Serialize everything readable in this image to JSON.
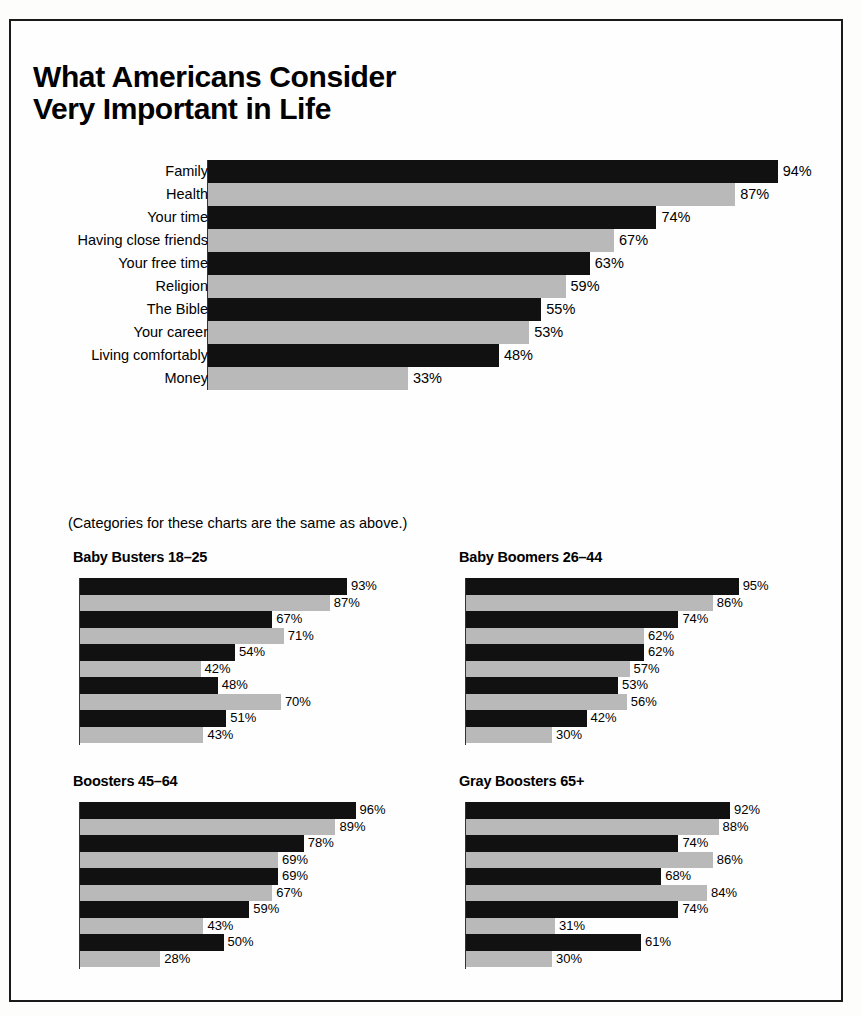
{
  "title": {
    "line1": "What Americans Consider",
    "line2": "Very Important in Life"
  },
  "note": "(Categories for these charts are the same as above.)",
  "chart_data": {
    "type": "bar",
    "title": "What Americans Consider Very Important in Life",
    "xlabel": "",
    "ylabel": "",
    "xlim": [
      0,
      100
    ],
    "grid": false,
    "legend": "none",
    "orientation": "horizontal",
    "value_suffix": "%",
    "note": "(Categories for these charts are the same as above.)",
    "categories": [
      "Family",
      "Health",
      "Your time",
      "Having close friends",
      "Your free time",
      "Religion",
      "The Bible",
      "Your career",
      "Living comfortably",
      "Money"
    ],
    "panels": [
      {
        "id": "overall",
        "title": "",
        "values": [
          94,
          87,
          74,
          67,
          63,
          59,
          55,
          53,
          48,
          33
        ],
        "labels": [
          "94%",
          "87%",
          "74%",
          "67%",
          "63%",
          "59%",
          "55%",
          "53%",
          "48%",
          "33%"
        ]
      },
      {
        "id": "baby-busters",
        "title": "Baby Busters 18–25",
        "values": [
          93,
          87,
          67,
          71,
          54,
          42,
          48,
          70,
          51,
          43
        ],
        "labels": [
          "93%",
          "87%",
          "67%",
          "71%",
          "54%",
          "42%",
          "48%",
          "70%",
          "51%",
          "43%"
        ]
      },
      {
        "id": "baby-boomers",
        "title": "Baby Boomers 26–44",
        "values": [
          95,
          86,
          74,
          62,
          62,
          57,
          53,
          56,
          42,
          30
        ],
        "labels": [
          "95%",
          "86%",
          "74%",
          "62%",
          "62%",
          "57%",
          "53%",
          "56%",
          "42%",
          "30%"
        ]
      },
      {
        "id": "boosters",
        "title": "Boosters 45–64",
        "values": [
          96,
          89,
          78,
          69,
          69,
          67,
          59,
          43,
          50,
          28
        ],
        "labels": [
          "96%",
          "89%",
          "78%",
          "69%",
          "69%",
          "67%",
          "59%",
          "43%",
          "50%",
          "28%"
        ]
      },
      {
        "id": "gray-boosters",
        "title": "Gray Boosters 65+",
        "values": [
          92,
          88,
          74,
          86,
          68,
          84,
          74,
          31,
          61,
          30
        ],
        "labels": [
          "92%",
          "88%",
          "74%",
          "86%",
          "68%",
          "84%",
          "74%",
          "31%",
          "61%",
          "30%"
        ]
      }
    ],
    "colors": {
      "bar_dark": "#111111",
      "bar_light": "#b9b9b9",
      "text": "#000000",
      "frame": "#1a1a1a",
      "background": "#fefefe"
    }
  }
}
